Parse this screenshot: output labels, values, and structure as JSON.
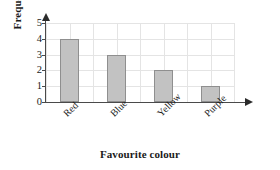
{
  "chart_data": {
    "type": "bar",
    "title": "",
    "subtitle": "",
    "xlabel": "Favourite colour",
    "ylabel": "Frequency",
    "categories": [
      "Red",
      "Blue",
      "Yellow",
      "Purple"
    ],
    "values": [
      4,
      3,
      2,
      1
    ],
    "series": [
      {
        "name": "Frequency",
        "values": [
          4,
          3,
          2,
          1
        ]
      }
    ],
    "ylim": [
      0,
      5
    ],
    "y_ticks": [
      0,
      1,
      2,
      3,
      4,
      5
    ],
    "y_tick_labels": [
      "0",
      "1",
      "2",
      "3",
      "4",
      "5"
    ],
    "grid": true,
    "legend": false,
    "legend_position": "none",
    "annotations": [],
    "colors": {
      "bar_fill": "#c2c2c2",
      "bar_border": "#8f8f8f",
      "axis": "#4a4a4a",
      "gridline": "#e4e4e4",
      "text": "#1a1a1a",
      "background": "#ffffff"
    },
    "category_label_rotation": -45,
    "axis_arrows": true
  }
}
